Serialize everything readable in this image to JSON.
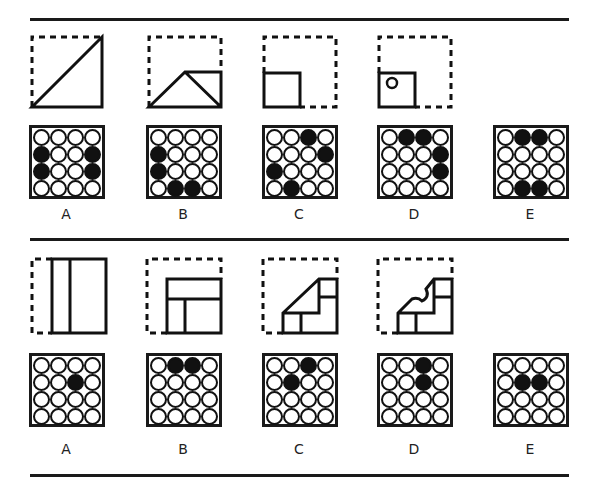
{
  "puzzle1": {
    "figures": [
      "fold-diagonal",
      "fold-triangle",
      "fold-square",
      "fold-square-hole"
    ],
    "options": [
      {
        "label": "A",
        "grid": [
          [
            0,
            0,
            0,
            0
          ],
          [
            1,
            0,
            0,
            1
          ],
          [
            1,
            0,
            0,
            1
          ],
          [
            0,
            0,
            0,
            0
          ]
        ]
      },
      {
        "label": "B",
        "grid": [
          [
            0,
            0,
            0,
            0
          ],
          [
            1,
            0,
            0,
            0
          ],
          [
            1,
            0,
            0,
            0
          ],
          [
            0,
            1,
            1,
            0
          ]
        ]
      },
      {
        "label": "C",
        "grid": [
          [
            0,
            0,
            1,
            0
          ],
          [
            0,
            0,
            0,
            1
          ],
          [
            1,
            0,
            0,
            0
          ],
          [
            0,
            1,
            0,
            0
          ]
        ]
      },
      {
        "label": "D",
        "grid": [
          [
            0,
            1,
            1,
            0
          ],
          [
            0,
            0,
            0,
            1
          ],
          [
            0,
            0,
            0,
            1
          ],
          [
            0,
            0,
            0,
            0
          ]
        ]
      },
      {
        "label": "E",
        "grid": [
          [
            0,
            1,
            1,
            0
          ],
          [
            0,
            0,
            0,
            0
          ],
          [
            0,
            0,
            0,
            0
          ],
          [
            0,
            1,
            1,
            0
          ]
        ]
      }
    ]
  },
  "puzzle2": {
    "figures": [
      "fold-vertical",
      "fold-corner",
      "fold-stair",
      "fold-stair-notch"
    ],
    "options": [
      {
        "label": "A",
        "grid": [
          [
            0,
            0,
            0,
            0
          ],
          [
            0,
            0,
            1,
            0
          ],
          [
            0,
            0,
            0,
            0
          ],
          [
            0,
            0,
            0,
            0
          ]
        ]
      },
      {
        "label": "B",
        "grid": [
          [
            0,
            1,
            1,
            0
          ],
          [
            0,
            0,
            0,
            0
          ],
          [
            0,
            0,
            0,
            0
          ],
          [
            0,
            0,
            0,
            0
          ]
        ]
      },
      {
        "label": "C",
        "grid": [
          [
            0,
            0,
            1,
            0
          ],
          [
            0,
            1,
            0,
            0
          ],
          [
            0,
            0,
            0,
            0
          ],
          [
            0,
            0,
            0,
            0
          ]
        ]
      },
      {
        "label": "D",
        "grid": [
          [
            0,
            0,
            1,
            0
          ],
          [
            0,
            0,
            1,
            0
          ],
          [
            0,
            0,
            0,
            0
          ],
          [
            0,
            0,
            0,
            0
          ]
        ]
      },
      {
        "label": "E",
        "grid": [
          [
            0,
            0,
            0,
            0
          ],
          [
            0,
            1,
            1,
            0
          ],
          [
            0,
            0,
            0,
            0
          ],
          [
            0,
            0,
            0,
            0
          ]
        ]
      }
    ]
  },
  "colors": {
    "ink": "#1a1a1a",
    "background": "#ffffff"
  }
}
